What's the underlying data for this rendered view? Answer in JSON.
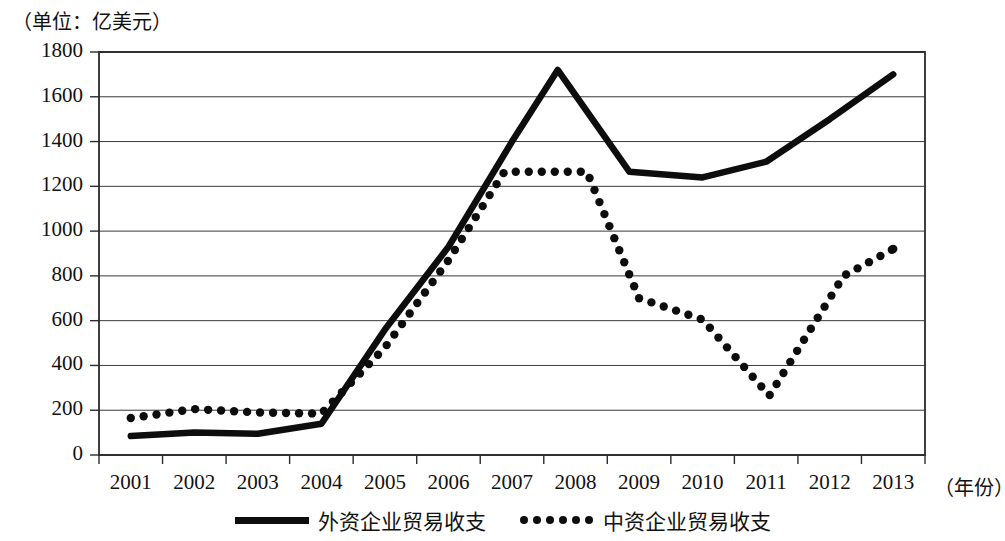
{
  "chart_data": {
    "type": "line",
    "title": "",
    "unit_note": "（单位：亿美元）",
    "xlabel": "（年份）",
    "ylabel": "",
    "categories": [
      "2001",
      "2002",
      "2003",
      "2004",
      "2005",
      "2006",
      "2007",
      "2008",
      "2009",
      "2010",
      "2011",
      "2012",
      "2013"
    ],
    "ylim": [
      0,
      1800
    ],
    "ytick_labels": [
      "0",
      "200",
      "400",
      "600",
      "800",
      "1000",
      "1200",
      "1400",
      "1600",
      "1800"
    ],
    "ytick_values": [
      0,
      200,
      400,
      600,
      800,
      1000,
      1200,
      1400,
      1600,
      1800
    ],
    "grid": true,
    "legend_position": "bottom-center",
    "series": [
      {
        "name": "外资企业贸易收支",
        "style": "solid",
        "color": "#0d0d0d",
        "values": [
          85,
          100,
          95,
          140,
          560,
          930,
          1400,
          1720,
          1265,
          1240,
          1310,
          1500,
          1700
        ],
        "peak_between": {
          "label": "2007-2008 peak",
          "value": 1720
        }
      },
      {
        "name": "中资企业贸易收支",
        "style": "dotted",
        "color": "#0d0d0d",
        "values": [
          165,
          205,
          190,
          185,
          480,
          870,
          1265,
          1265,
          700,
          605,
          265,
          800,
          920
        ]
      }
    ]
  },
  "legend": {
    "items": [
      {
        "label": "外资企业贸易收支",
        "style": "solid"
      },
      {
        "label": "中资企业贸易收支",
        "style": "dotted"
      }
    ]
  }
}
